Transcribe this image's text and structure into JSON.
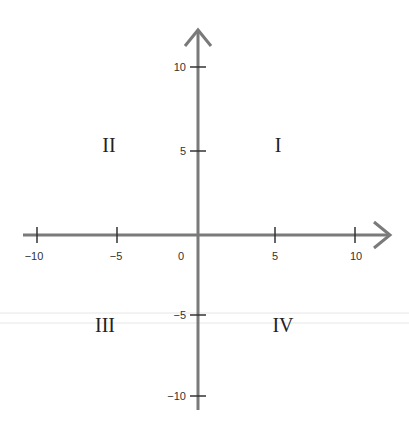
{
  "diagram": {
    "type": "coordinate-plane",
    "axes": {
      "color": "#7a7a7a",
      "x_ticks": [
        {
          "label": "−10",
          "value": -10
        },
        {
          "label": "−5",
          "value": -5
        },
        {
          "label": "5",
          "value": 5
        },
        {
          "label": "10",
          "value": 10
        }
      ],
      "y_ticks": [
        {
          "label": "10",
          "value": 10
        },
        {
          "label": "5",
          "value": 5
        },
        {
          "label": "−5",
          "value": -5
        },
        {
          "label": "−10",
          "value": -10
        }
      ],
      "origin_label": "0"
    },
    "quadrants": {
      "q1": "I",
      "q2": "II",
      "q3": "III",
      "q4": "IV"
    }
  }
}
